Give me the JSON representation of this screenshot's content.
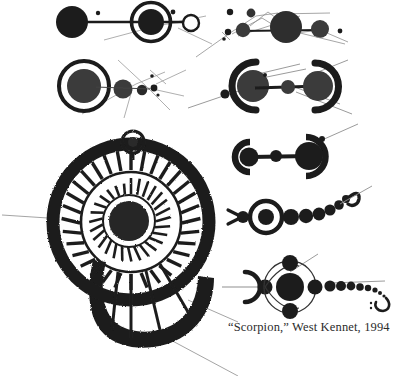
{
  "image": {
    "kind": "crop-circle-formation-diagram",
    "background_color": "#ffffff",
    "ink_color": "#1a1a1a",
    "line_color": "#8a8a8a",
    "caption_color": "#2b2b2b",
    "width": 403,
    "height": 376
  },
  "caption": {
    "text": "“Scorpion,” West Kennet, 1994",
    "name": "Scorpion",
    "location": "West Kennet",
    "year": "1994"
  },
  "figures": [
    {
      "id": "fig-top-left",
      "label": "dumbbell with ringed circle and open circle",
      "elements": [
        "filled-disc",
        "connecting-bar",
        "annulus-with-filled-core",
        "connecting-bar",
        "open-ring",
        "satellite-dots",
        "survey-lines"
      ]
    },
    {
      "id": "fig-top-right",
      "label": "chain of discs with angled survey lines",
      "elements": [
        "small-disc",
        "small-disc",
        "medium-disc",
        "large-disc",
        "medium-disc",
        "dot",
        "survey-lines"
      ]
    },
    {
      "id": "fig-mid-left",
      "label": "ringed circle with diminishing disc chain",
      "elements": [
        "annulus-with-filled-core",
        "medium-disc",
        "small-disc",
        "tiny-disc",
        "radiating-lines"
      ]
    },
    {
      "id": "fig-mid-right",
      "label": "paired crescents enclosing discs joined by a bar",
      "elements": [
        "crescent-open-right",
        "large-disc",
        "connecting-bar",
        "small-disc",
        "large-disc",
        "crescent-open-left",
        "survey-lines",
        "satellite-dot"
      ]
    },
    {
      "id": "fig-row3-right",
      "label": "bracket crescents with barbell of discs",
      "elements": [
        "crescent-open-right",
        "disc",
        "connecting-bar",
        "small-disc",
        "large-disc",
        "crescent-open-left",
        "satellite-dot",
        "survey-line"
      ]
    },
    {
      "id": "fig-row4-right",
      "label": "scorpion: pincers, ringed body, curving tail of discs",
      "elements": [
        "pincer-fork",
        "node-disc",
        "annulus-with-filled-core",
        "disc-chain",
        "curving-tail",
        "tail-hook",
        "survey-line"
      ]
    },
    {
      "id": "fig-scorpion-main",
      "label": "Scorpion formation: crescent head, orbital ring with four satellites, long tapering tail ending in hook",
      "elements": [
        "crescent-open-left",
        "node-disc",
        "orbital-ring",
        "satellite-top",
        "satellite-bottom",
        "large-central-disc",
        "node-disc",
        "tapering-disc-tail",
        "tail-hook",
        "survey-lines"
      ]
    },
    {
      "id": "fig-wheel",
      "label": "large spoked wheel / rosette with spiral tail and top knob",
      "elements": [
        "outer-thick-ring",
        "outer-spoke-ring",
        "inner-spoke-rosette",
        "dense-hub",
        "spiral-tail",
        "top-knob",
        "pointer-lines"
      ]
    }
  ],
  "pointers": [
    {
      "id": "pointer-left",
      "label": "leader line to wheel from left margin"
    },
    {
      "id": "pointer-caption",
      "label": "leader line from wheel tail to caption area"
    },
    {
      "id": "pointer-bottom",
      "label": "leader line descending to bottom edge"
    }
  ]
}
